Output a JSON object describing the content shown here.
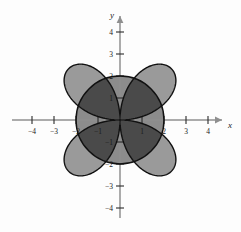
{
  "figure": {
    "title": "",
    "background_color": "#fdfdfd"
  },
  "axes": {
    "x_label": "x",
    "y_label": "y",
    "axis_color": "#8f8f8f",
    "origin_px": {
      "x": 120,
      "y": 120
    },
    "unit_px": 22,
    "x_ticks": [
      {
        "value": -4,
        "label": "-4"
      },
      {
        "value": -3,
        "label": "-3"
      },
      {
        "value": -2,
        "label": "-2"
      },
      {
        "value": -1,
        "label": "-1"
      },
      {
        "value": 1,
        "label": "1"
      },
      {
        "value": 2,
        "label": "2"
      },
      {
        "value": 3,
        "label": "3"
      },
      {
        "value": 4,
        "label": "4"
      }
    ],
    "y_ticks": [
      {
        "value": 4,
        "label": "4"
      },
      {
        "value": 3,
        "label": "3"
      },
      {
        "value": 2,
        "label": "2"
      },
      {
        "value": 1,
        "label": "1"
      },
      {
        "value": -1,
        "label": "-1"
      },
      {
        "value": -2,
        "label": "-2"
      },
      {
        "value": -3,
        "label": "-3"
      },
      {
        "value": -4,
        "label": "-4"
      }
    ]
  },
  "chart_data": {
    "type": "line",
    "title": "",
    "xlabel": "x",
    "ylabel": "y",
    "coordinate_system": "polar",
    "xlim": [
      -4.8,
      4.8
    ],
    "ylim": [
      -4.8,
      4.8
    ],
    "grid": false,
    "legend": "none",
    "series": [
      {
        "name": "four-petaled rose",
        "equation": "r = 3.3 cos(2θ)",
        "kind": "polar_rose",
        "petals": 4,
        "amplitude": 3.3,
        "petal_tip_angles_deg": [
          45,
          135,
          225,
          315
        ],
        "fill_color": "#9a9a9a",
        "stroke_color": "#111111",
        "stroke_width": 1.4
      },
      {
        "name": "circle",
        "equation": "r = 2",
        "kind": "circle",
        "radius": 2,
        "center": [
          0,
          0
        ],
        "fill_color": "#8c8c8c",
        "stroke_color": "#111111",
        "stroke_width": 1.4
      }
    ],
    "shaded_region": {
      "name": "intersection of rose and circle",
      "fill_color": "#4a4a4a",
      "description": "region common to the four-petaled rose and the circle of radius 2"
    },
    "annotations": []
  }
}
